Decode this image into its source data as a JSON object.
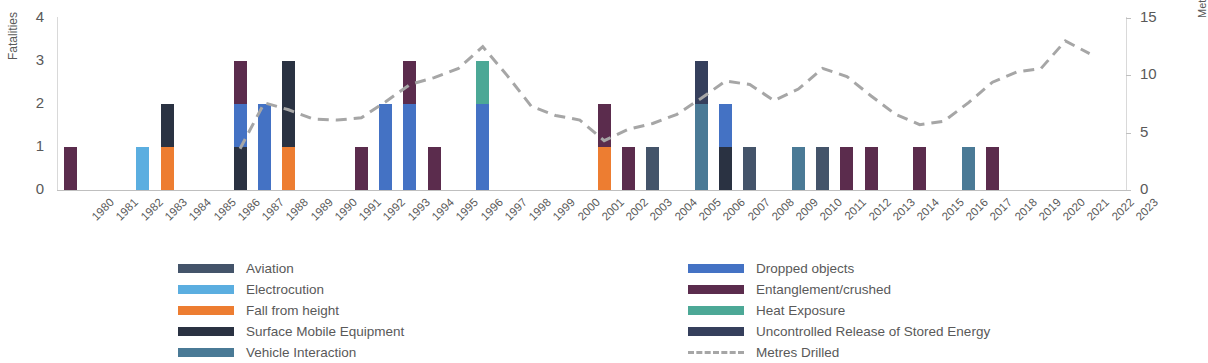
{
  "chart_data": {
    "type": "bar",
    "title": "",
    "xlabel": "",
    "ylabel": "Fatalities",
    "y2label": "Metres Drilled (Millions)",
    "ylim": [
      0,
      4
    ],
    "y2lim": [
      0,
      15
    ],
    "yticks": [
      "0",
      "1",
      "2",
      "3",
      "4"
    ],
    "y2ticks": [
      "0",
      "5",
      "10",
      "15"
    ],
    "grid": false,
    "legend_position": "bottom",
    "stacked": true,
    "categories": [
      "1980",
      "1981",
      "1982",
      "1983",
      "1984",
      "1985",
      "1986",
      "1987",
      "1988",
      "1989",
      "1990",
      "1991",
      "1992",
      "1993",
      "1994",
      "1995",
      "1996",
      "1997",
      "1998",
      "1999",
      "2000",
      "2001",
      "2002",
      "2003",
      "2004",
      "2005",
      "2006",
      "2007",
      "2008",
      "2009",
      "2010",
      "2011",
      "2012",
      "2013",
      "2014",
      "2015",
      "2016",
      "2017",
      "2018",
      "2019",
      "2020",
      "2021",
      "2022",
      "2023"
    ],
    "series": [
      {
        "name": "Aviation",
        "color": "#44546A",
        "values": [
          0,
          0,
          0,
          0,
          0,
          0,
          0,
          0,
          0,
          0,
          0,
          0,
          0,
          0,
          0,
          0,
          0,
          0,
          0,
          0,
          0,
          0,
          0,
          0,
          1,
          0,
          0,
          0,
          1,
          0,
          0,
          1,
          0,
          0,
          0,
          0,
          0,
          0,
          0,
          0,
          0,
          0,
          0,
          0
        ]
      },
      {
        "name": "Electrocution",
        "color": "#5BAEE0",
        "values": [
          0,
          0,
          0,
          1,
          0,
          0,
          0,
          0,
          0,
          0,
          0,
          0,
          0,
          0,
          0,
          0,
          0,
          0,
          0,
          0,
          0,
          0,
          0,
          0,
          0,
          0,
          0,
          0,
          0,
          0,
          0,
          0,
          0,
          0,
          0,
          0,
          0,
          0,
          0,
          0,
          0,
          0,
          0,
          0
        ]
      },
      {
        "name": "Fall from height",
        "color": "#ED7D31",
        "values": [
          0,
          0,
          0,
          0,
          1,
          0,
          0,
          0,
          0,
          1,
          0,
          0,
          0,
          0,
          0,
          0,
          0,
          0,
          0,
          0,
          0,
          0,
          1,
          0,
          0,
          0,
          0,
          0,
          0,
          0,
          0,
          0,
          0,
          0,
          0,
          0,
          0,
          0,
          0,
          0,
          0,
          0,
          0,
          0
        ]
      },
      {
        "name": "Surface Mobile Equipment",
        "color": "#2A3242",
        "values": [
          0,
          0,
          0,
          0,
          1,
          0,
          0,
          1,
          0,
          2,
          0,
          0,
          0,
          0,
          0,
          0,
          0,
          0,
          0,
          0,
          0,
          0,
          0,
          0,
          0,
          0,
          0,
          1,
          0,
          0,
          0,
          0,
          0,
          0,
          0,
          0,
          0,
          0,
          0,
          0,
          0,
          0,
          0,
          0
        ]
      },
      {
        "name": "Vehicle Interaction",
        "color": "#4A7A96",
        "values": [
          0,
          0,
          0,
          0,
          0,
          0,
          0,
          0,
          0,
          0,
          0,
          0,
          0,
          0,
          0,
          0,
          0,
          0,
          0,
          0,
          0,
          0,
          0,
          0,
          0,
          0,
          2,
          0,
          0,
          0,
          1,
          0,
          0,
          0,
          0,
          0,
          0,
          1,
          0,
          0,
          0,
          0,
          0,
          0
        ]
      },
      {
        "name": "Dropped objects",
        "color": "#4472C4",
        "values": [
          0,
          0,
          0,
          0,
          0,
          0,
          0,
          1,
          2,
          0,
          0,
          0,
          0,
          2,
          2,
          0,
          0,
          2,
          0,
          0,
          0,
          0,
          0,
          0,
          0,
          0,
          0,
          1,
          0,
          0,
          0,
          0,
          0,
          0,
          0,
          0,
          0,
          0,
          0,
          0,
          0,
          0,
          0,
          0
        ]
      },
      {
        "name": "Entanglement/crushed",
        "color": "#5B2C4D",
        "values": [
          1,
          0,
          0,
          0,
          0,
          0,
          0,
          1,
          0,
          0,
          0,
          0,
          1,
          0,
          1,
          1,
          0,
          0,
          0,
          0,
          0,
          0,
          1,
          1,
          0,
          0,
          0,
          0,
          0,
          0,
          0,
          0,
          1,
          1,
          0,
          1,
          0,
          0,
          1,
          0,
          0,
          0,
          0,
          0
        ]
      },
      {
        "name": "Heat Exposure",
        "color": "#4CA896",
        "values": [
          0,
          0,
          0,
          0,
          0,
          0,
          0,
          0,
          0,
          0,
          0,
          0,
          0,
          0,
          0,
          0,
          0,
          1,
          0,
          0,
          0,
          0,
          0,
          0,
          0,
          0,
          0,
          0,
          0,
          0,
          0,
          0,
          0,
          0,
          0,
          0,
          0,
          0,
          0,
          0,
          0,
          0,
          0,
          0
        ]
      },
      {
        "name": "Uncontrolled Release of Stored Energy",
        "color": "#353F5C",
        "values": [
          0,
          0,
          0,
          0,
          0,
          0,
          0,
          0,
          0,
          0,
          0,
          0,
          0,
          0,
          0,
          0,
          0,
          0,
          0,
          0,
          0,
          0,
          0,
          0,
          0,
          0,
          1,
          0,
          0,
          0,
          0,
          0,
          0,
          0,
          0,
          0,
          0,
          0,
          0,
          0,
          0,
          0,
          0,
          0
        ]
      }
    ],
    "line_series": {
      "name": "Metres Drilled",
      "color": "#a6a6a6",
      "style": "dashed",
      "axis": "right",
      "x": [
        "1987",
        "1988",
        "1989",
        "1990",
        "1991",
        "1992",
        "1993",
        "1994",
        "1995",
        "1996",
        "1997",
        "1998",
        "1999",
        "2000",
        "2001",
        "2002",
        "2003",
        "2004",
        "2005",
        "2006",
        "2007",
        "2008",
        "2009",
        "2010",
        "2011",
        "2012",
        "2013",
        "2014",
        "2015",
        "2016",
        "2017",
        "2018",
        "2019",
        "2020",
        "2021",
        "2022"
      ],
      "values": [
        3.6,
        7.6,
        7.0,
        6.2,
        6.1,
        6.3,
        7.7,
        9.2,
        9.8,
        10.6,
        12.5,
        10.0,
        7.3,
        6.5,
        6.1,
        4.3,
        5.3,
        5.8,
        6.6,
        8.0,
        9.5,
        9.2,
        7.8,
        8.8,
        10.6,
        9.9,
        8.2,
        6.6,
        5.7,
        6.0,
        7.6,
        9.4,
        10.3,
        10.6,
        13.0,
        11.9
      ]
    }
  },
  "legend": {
    "left_column": [
      {
        "label": "Aviation",
        "color": "#44546A",
        "style": "box"
      },
      {
        "label": "Electrocution",
        "color": "#5BAEE0",
        "style": "box"
      },
      {
        "label": "Fall from height",
        "color": "#ED7D31",
        "style": "box"
      },
      {
        "label": "Surface Mobile Equipment",
        "color": "#2A3242",
        "style": "box"
      },
      {
        "label": "Vehicle Interaction",
        "color": "#4A7A96",
        "style": "box"
      }
    ],
    "right_column": [
      {
        "label": "Dropped objects",
        "color": "#4472C4",
        "style": "box"
      },
      {
        "label": "Entanglement/crushed",
        "color": "#5B2C4D",
        "style": "box"
      },
      {
        "label": "Heat Exposure",
        "color": "#4CA896",
        "style": "box"
      },
      {
        "label": "Uncontrolled Release of Stored Energy",
        "color": "#353F5C",
        "style": "box"
      },
      {
        "label": "Metres Drilled",
        "color": "#a6a6a6",
        "style": "dash"
      }
    ]
  }
}
